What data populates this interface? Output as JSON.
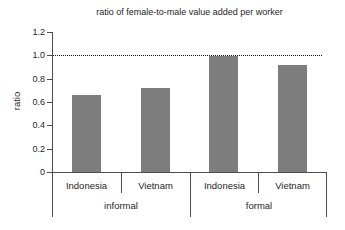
{
  "colors": {
    "bar": "#7d7d7d",
    "axis": "#4d4d4d",
    "text": "#262626",
    "reference_line": "#1a1a1a",
    "background": "#ffffff"
  },
  "chart_data": {
    "type": "bar",
    "title": "ratio of female-to-male value added per worker",
    "xlabel": "",
    "ylabel": "ratio",
    "categories": [
      "Indonesia",
      "Vietnam",
      "Indonesia",
      "Vietnam"
    ],
    "values": [
      0.66,
      0.72,
      0.99,
      0.92
    ],
    "groups": [
      {
        "label": "informal",
        "span": [
          0,
          2
        ]
      },
      {
        "label": "formal",
        "span": [
          2,
          4
        ]
      }
    ],
    "ytick_values": [
      0,
      0.2,
      0.4,
      0.6,
      0.8,
      1.0,
      1.2
    ],
    "ytick_labels": [
      "0",
      "0.2",
      "0.4",
      "0.6",
      "0.8",
      "1.0",
      "1.2"
    ],
    "ylim": [
      0,
      1.2
    ],
    "reference_line": 1.0,
    "grid": false,
    "legend": null
  }
}
